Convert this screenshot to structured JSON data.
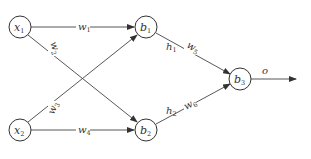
{
  "diagram": {
    "title": "",
    "colors": {
      "stroke": "#333333",
      "background": "#ffffff"
    },
    "nodes": [
      {
        "id": "x1",
        "base": "x",
        "sub": "1",
        "cx": 20,
        "cy": 27
      },
      {
        "id": "x2",
        "base": "x",
        "sub": "2",
        "cx": 20,
        "cy": 130
      },
      {
        "id": "b1",
        "base": "b",
        "sub": "1",
        "cx": 146,
        "cy": 27
      },
      {
        "id": "b2",
        "base": "b",
        "sub": "2",
        "cx": 146,
        "cy": 130
      },
      {
        "id": "b3",
        "base": "b",
        "sub": "3",
        "cx": 240,
        "cy": 79
      }
    ],
    "edges": [
      {
        "from": "x1",
        "to": "b1",
        "label_base": "w",
        "label_sub": "1"
      },
      {
        "from": "x1",
        "to": "b2",
        "label_base": "w",
        "label_sub": "2"
      },
      {
        "from": "x2",
        "to": "b1",
        "label_base": "w",
        "label_sub": "3"
      },
      {
        "from": "x2",
        "to": "b2",
        "label_base": "w",
        "label_sub": "4"
      },
      {
        "from": "b1",
        "to": "b3",
        "label_base": "w",
        "label_sub": "5",
        "extra_base": "h",
        "extra_sub": "1"
      },
      {
        "from": "b2",
        "to": "b3",
        "label_base": "w",
        "label_sub": "6",
        "extra_base": "h",
        "extra_sub": "2"
      }
    ],
    "output": {
      "from": "b3",
      "label": "o"
    }
  }
}
